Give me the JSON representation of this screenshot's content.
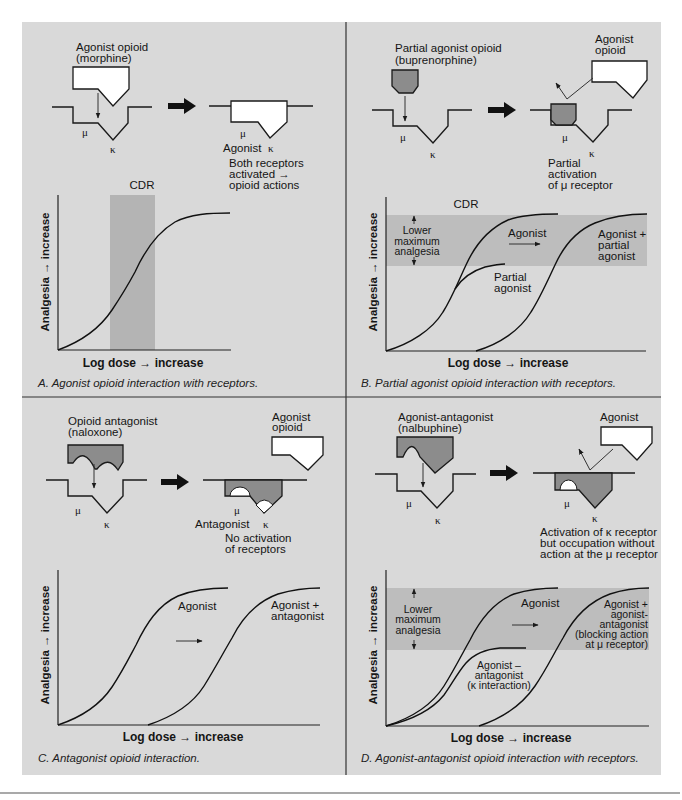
{
  "colors": {
    "panel_background": "#d9d9d9",
    "cdr_band_a": "#b4b4b4",
    "cdr_band_bd": "#bdbdbd",
    "drug_gray": "#8c8c8c",
    "drug_white": "#ffffff",
    "line": "#1a1a1a"
  },
  "figure": {
    "panel_a": {
      "drug_label_1": "Agonist opioid",
      "drug_label_2": "(morphine)",
      "mu": "μ",
      "kappa": "κ",
      "result_mu": "μ",
      "result_kappa": "κ",
      "result_drug": "Agonist",
      "result_1": "Both receptors",
      "result_2": "activated →",
      "result_3": "opioid actions",
      "band_label": "CDR",
      "y_axis": "Analgesia → increase",
      "x_axis": "Log dose → increase",
      "caption": "A. Agonist opioid interaction with receptors."
    },
    "panel_b": {
      "drug_label_1": "Partial agonist opioid",
      "drug_label_2": "(buprenorphine)",
      "mu": "μ",
      "kappa": "κ",
      "result_agonist_1": "Agonist",
      "result_agonist_2": "opioid",
      "result_mu": "μ",
      "result_kappa": "κ",
      "result_1": "Partial",
      "result_2": "activation",
      "result_3": "of μ receptor",
      "band_label": "CDR",
      "lower_1": "Lower",
      "lower_2": "maximum",
      "lower_3": "analgesia",
      "curve_agonist": "Agonist",
      "curve_partial_1": "Partial",
      "curve_partial_2": "agonist",
      "curve_combined_1": "Agonist +",
      "curve_combined_2": "partial",
      "curve_combined_3": "agonist",
      "y_axis": "Analgesia → increase",
      "x_axis": "Log dose → increase",
      "caption": "B. Partial agonist opioid interaction with receptors."
    },
    "panel_c": {
      "drug_label_1": "Opioid antagonist",
      "drug_label_2": "(naloxone)",
      "mu": "μ",
      "kappa": "κ",
      "result_agonist_1": "Agonist",
      "result_agonist_2": "opioid",
      "result_mu": "μ",
      "result_kappa": "κ",
      "result_drug": "Antagonist",
      "result_1": "No activation",
      "result_2": "of receptors",
      "curve_agonist": "Agonist",
      "curve_combined_1": "Agonist +",
      "curve_combined_2": "antagonist",
      "y_axis": "Analgesia → increase",
      "x_axis": "Log dose → increase",
      "caption": "C. Antagonist opioid interaction."
    },
    "panel_d": {
      "drug_label_1": "Agonist-antagonist",
      "drug_label_2": "(nalbuphine)",
      "mu": "μ",
      "kappa": "κ",
      "result_agonist": "Agonist",
      "result_mu": "μ",
      "result_kappa": "κ",
      "result_1": "Activation of κ receptor",
      "result_2": "but occupation without",
      "result_3": "action at the μ receptor",
      "lower_1": "Lower",
      "lower_2": "maximum",
      "lower_3": "analgesia",
      "curve_agonist": "Agonist",
      "curve_mixed_1": "Agonist –",
      "curve_mixed_2": "antagonist",
      "curve_mixed_3": "(κ interaction)",
      "curve_combined_1": "Agonist +",
      "curve_combined_2": "agonist-",
      "curve_combined_3": "antagonist",
      "curve_combined_4": "(blocking action",
      "curve_combined_5": "at μ receptor)",
      "y_axis": "Analgesia → increase",
      "x_axis": "Log dose → increase",
      "caption": "D. Agonist-antagonist opioid interaction with receptors."
    }
  }
}
